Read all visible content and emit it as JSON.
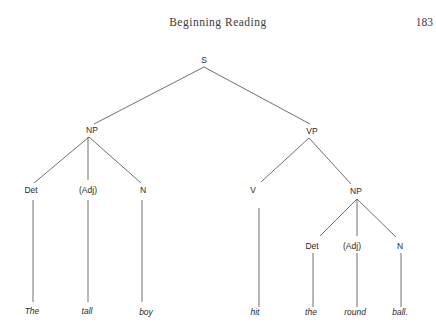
{
  "page": {
    "running_head": "Beginning Reading",
    "page_number": "183"
  },
  "tree": {
    "nodes": {
      "s": "S",
      "np1": "NP",
      "vp": "VP",
      "det1": "Det",
      "adj1": "(Adj)",
      "n1": "N",
      "v": "V",
      "np2": "NP",
      "det2": "Det",
      "adj2": "(Adj)",
      "n2": "N"
    },
    "words": [
      "The",
      "tall",
      "boy",
      "hit",
      "the",
      "round",
      "ball."
    ]
  }
}
